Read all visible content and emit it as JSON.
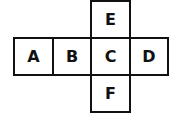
{
  "diagram": {
    "cells": [
      {
        "id": "A",
        "label": "A"
      },
      {
        "id": "B",
        "label": "B"
      },
      {
        "id": "C",
        "label": "C"
      },
      {
        "id": "D",
        "label": "D"
      },
      {
        "id": "E",
        "label": "E"
      },
      {
        "id": "F",
        "label": "F"
      }
    ]
  }
}
